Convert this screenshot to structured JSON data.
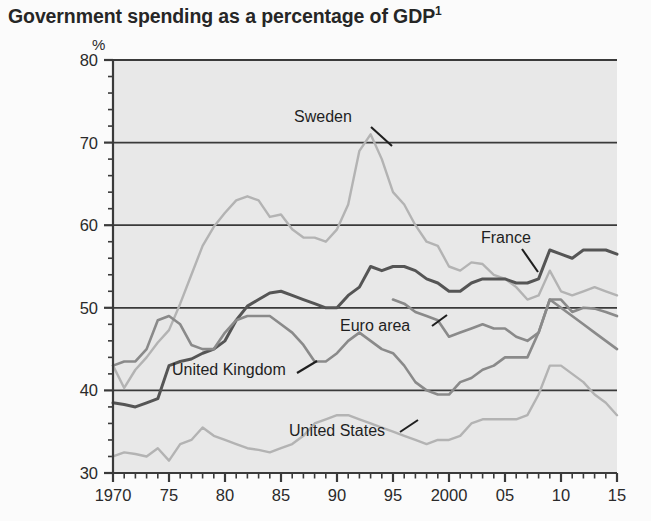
{
  "title": {
    "text": "Government spending as a percentage of GDP",
    "footnote_marker": "1"
  },
  "axis": {
    "unit": "%",
    "y_ticks": [
      "80",
      "70",
      "60",
      "50",
      "40",
      "30"
    ],
    "x_ticks": [
      "1970",
      "75",
      "80",
      "85",
      "90",
      "95",
      "2000",
      "05",
      "10",
      "15"
    ]
  },
  "annotations": {
    "sweden": "Sweden",
    "france": "France",
    "euro_area": "Euro area",
    "united_kingdom": "United Kingdom",
    "united_states": "United States"
  },
  "colors": {
    "plot_background": "#e8e8e8",
    "page_background": "#fbfbfb",
    "gridline": "#3a3a3a",
    "light_series": "#b3b3b3",
    "medium_series": "#8a8a8a",
    "dark_series": "#555555",
    "text": "#2a2a2a"
  },
  "chart_data": {
    "type": "line",
    "title": "Government spending as a percentage of GDP",
    "xlabel": "",
    "ylabel": "%",
    "xlim": [
      1970,
      2015
    ],
    "ylim": [
      30,
      80
    ],
    "grid": true,
    "legend": "inline-labels",
    "x": [
      1970,
      1971,
      1972,
      1973,
      1974,
      1975,
      1976,
      1977,
      1978,
      1979,
      1980,
      1981,
      1982,
      1983,
      1984,
      1985,
      1986,
      1987,
      1988,
      1989,
      1990,
      1991,
      1992,
      1993,
      1994,
      1995,
      1996,
      1997,
      1998,
      1999,
      2000,
      2001,
      2002,
      2003,
      2004,
      2005,
      2006,
      2007,
      2008,
      2009,
      2010,
      2011,
      2012,
      2013,
      2014,
      2015
    ],
    "series": [
      {
        "name": "Sweden",
        "color": "#b3b3b3",
        "values": [
          43.0,
          40.3,
          42.5,
          44.0,
          45.8,
          47.3,
          50.5,
          54.0,
          57.5,
          59.8,
          61.5,
          63.0,
          63.5,
          63.0,
          61.0,
          61.3,
          59.5,
          58.5,
          58.5,
          58.0,
          59.5,
          62.5,
          69.0,
          71.0,
          68.0,
          64.0,
          62.5,
          60.0,
          58.0,
          57.5,
          55.0,
          54.5,
          55.5,
          55.3,
          54.0,
          53.5,
          52.5,
          51.0,
          51.5,
          54.5,
          52.0,
          51.5,
          52.0,
          52.5,
          52.0,
          51.5
        ]
      },
      {
        "name": "France",
        "color": "#555555",
        "values": [
          38.5,
          38.3,
          38.0,
          38.5,
          39.0,
          43.0,
          43.5,
          43.8,
          44.5,
          45.0,
          46.0,
          48.5,
          50.2,
          51.0,
          51.8,
          52.0,
          51.5,
          51.0,
          50.5,
          50.0,
          50.0,
          51.5,
          52.5,
          55.0,
          54.5,
          55.0,
          55.0,
          54.5,
          53.5,
          53.0,
          52.0,
          52.0,
          53.0,
          53.5,
          53.5,
          53.5,
          53.0,
          53.0,
          53.5,
          57.0,
          56.5,
          56.0,
          57.0,
          57.0,
          57.0,
          56.5
        ]
      },
      {
        "name": "Euro area",
        "color": "#8a8a8a",
        "values": [
          null,
          null,
          null,
          null,
          null,
          null,
          null,
          null,
          null,
          null,
          null,
          null,
          null,
          null,
          null,
          null,
          null,
          null,
          null,
          null,
          null,
          null,
          null,
          null,
          null,
          51.0,
          50.5,
          49.5,
          49.0,
          48.5,
          46.5,
          47.0,
          47.5,
          48.0,
          47.5,
          47.5,
          46.5,
          46.0,
          47.0,
          51.0,
          51.0,
          49.5,
          50.0,
          49.9,
          49.5,
          49.0
        ]
      },
      {
        "name": "United Kingdom",
        "color": "#8a8a8a",
        "values": [
          43.0,
          43.5,
          43.5,
          45.0,
          48.5,
          49.0,
          48.0,
          45.5,
          45.0,
          45.0,
          47.0,
          48.5,
          49.0,
          49.0,
          49.0,
          48.0,
          47.0,
          45.5,
          43.5,
          43.5,
          44.5,
          46.0,
          47.0,
          46.0,
          45.0,
          44.5,
          43.0,
          41.0,
          40.0,
          39.5,
          39.5,
          41.0,
          41.5,
          42.5,
          43.0,
          44.0,
          44.0,
          44.0,
          47.0,
          51.0,
          50.0,
          49.0,
          48.0,
          47.0,
          46.0,
          45.0
        ]
      },
      {
        "name": "United States",
        "color": "#b3b3b3",
        "values": [
          32.0,
          32.5,
          32.3,
          32.0,
          33.0,
          31.5,
          33.5,
          34.0,
          35.5,
          34.5,
          34.0,
          33.5,
          33.0,
          32.8,
          32.5,
          33.0,
          33.5,
          34.5,
          36.0,
          36.5,
          37.0,
          37.0,
          36.5,
          36.0,
          35.5,
          35.0,
          34.5,
          34.0,
          33.5,
          34.0,
          34.0,
          34.5,
          36.0,
          36.5,
          36.5,
          36.5,
          36.5,
          37.0,
          39.5,
          43.0,
          43.0,
          42.0,
          41.0,
          39.5,
          38.5,
          37.0
        ]
      }
    ]
  }
}
